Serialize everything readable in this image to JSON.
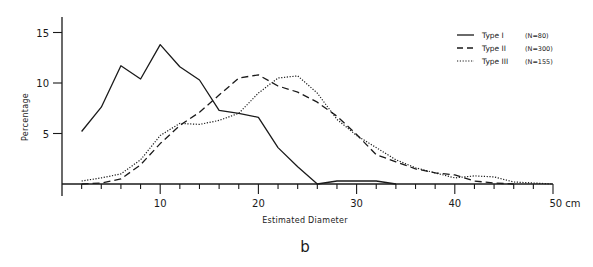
{
  "chart_data": {
    "type": "line",
    "title": "",
    "panel_label": "b",
    "xlabel": "Estimated Diameter",
    "ylabel": "Percentage",
    "xlim": [
      0,
      50
    ],
    "ylim": [
      0,
      16
    ],
    "x_ticks": [
      10,
      20,
      30,
      40,
      50
    ],
    "x_tick_labels": [
      "10",
      "20",
      "30",
      "40",
      "50 cm"
    ],
    "x_minor_tick_step": 2,
    "y_ticks": [
      5,
      10,
      15
    ],
    "y_tick_labels": [
      "5",
      "10",
      "15"
    ],
    "grid": false,
    "legend_position": "top-right",
    "series": [
      {
        "name": "Type I",
        "n_label": "(N=80)",
        "style": "solid",
        "x": [
          2,
          4,
          6,
          8,
          10,
          12,
          14,
          16,
          18,
          20,
          22,
          24,
          26,
          28,
          30,
          32,
          34
        ],
        "values": [
          5.2,
          7.6,
          11.7,
          10.4,
          13.8,
          11.6,
          10.3,
          7.3,
          7.0,
          6.6,
          3.6,
          1.7,
          0.0,
          0.3,
          0.3,
          0.3,
          0.0
        ]
      },
      {
        "name": "Type II",
        "n_label": "(N=300)",
        "style": "dashed",
        "x": [
          2,
          4,
          6,
          8,
          10,
          12,
          14,
          16,
          18,
          20,
          22,
          24,
          26,
          28,
          30,
          32,
          34,
          36,
          38,
          40,
          42,
          44,
          46
        ],
        "values": [
          0.0,
          0.1,
          0.5,
          1.9,
          4.0,
          5.8,
          7.1,
          8.8,
          10.5,
          10.8,
          9.7,
          9.1,
          8.1,
          6.7,
          4.9,
          2.9,
          2.2,
          1.5,
          1.1,
          0.9,
          0.3,
          0.1,
          0.0
        ]
      },
      {
        "name": "Type III",
        "n_label": "(N=155)",
        "style": "dotted",
        "x": [
          2,
          4,
          6,
          8,
          10,
          12,
          14,
          16,
          18,
          20,
          22,
          24,
          26,
          28,
          30,
          32,
          34,
          36,
          38,
          40,
          42,
          44,
          46,
          48,
          50
        ],
        "values": [
          0.3,
          0.6,
          1.0,
          2.4,
          4.8,
          6.0,
          5.9,
          6.3,
          7.0,
          9.0,
          10.5,
          10.7,
          9.0,
          6.4,
          4.8,
          3.6,
          2.4,
          1.6,
          1.1,
          0.6,
          0.8,
          0.7,
          0.2,
          0.1,
          0.0
        ]
      }
    ]
  }
}
